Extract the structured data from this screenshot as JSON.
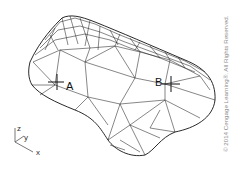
{
  "figure": {
    "point_labels": {
      "a": "A",
      "b": "B"
    },
    "axis_labels": {
      "x": "x",
      "y": "y",
      "z": "z"
    },
    "copyright": "© 2014 Cengage Learning®. All Rights Reserved."
  }
}
